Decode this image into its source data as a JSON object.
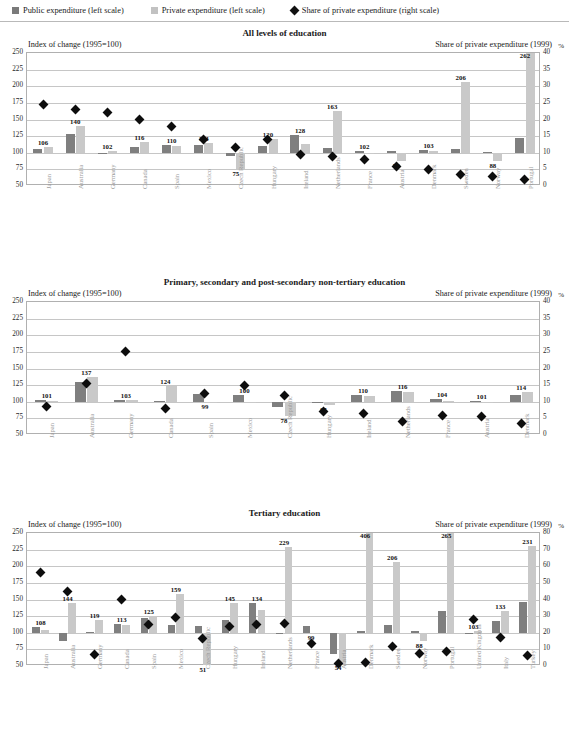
{
  "legend": {
    "items": [
      {
        "label": "Public expenditure (left scale)",
        "icon": "square-swatch-dark",
        "color": "#7a7a7a"
      },
      {
        "label": "Private expenditure (left scale)",
        "icon": "square-swatch-light",
        "color": "#c2c2c2"
      },
      {
        "label": "Share of private expenditure (right scale)",
        "icon": "diamond-marker",
        "color": "#111111"
      }
    ]
  },
  "chart_data": [
    {
      "type": "bar",
      "title": "All levels of education",
      "ylabel": "Index of change (1995=100)",
      "y2label": "Share of private expenditure (1999)",
      "pct_symbol": "%",
      "ylim": [
        50,
        250
      ],
      "yticks": [
        50,
        75,
        100,
        125,
        150,
        175,
        200,
        225,
        250
      ],
      "y2lim": [
        0,
        40
      ],
      "y2ticks": [
        0,
        5,
        10,
        15,
        20,
        25,
        30,
        35,
        40
      ],
      "grid": true,
      "legend_position": "top",
      "categories": [
        "Japan",
        "Australia",
        "Germany",
        "Canada",
        "Spain",
        "Mexico",
        "Czech Republic",
        "Hungary",
        "Ireland",
        "Netherlands",
        "France",
        "Austria",
        "Denmark",
        "Sweden",
        "Norway",
        "Portugal"
      ],
      "series": [
        {
          "name": "Public expenditure (left scale)",
          "values": [
            106,
            128,
            100,
            108,
            112,
            112,
            95,
            110,
            127,
            107,
            102,
            103,
            104,
            105,
            101,
            122
          ]
        },
        {
          "name": "Private expenditure (left scale)",
          "values": [
            108,
            140,
            102,
            116,
            110,
            114,
            75,
            120,
            113,
            163,
            100,
            88,
            102,
            206,
            88,
            262
          ]
        }
      ],
      "data_labels": [
        {
          "category": "Japan",
          "text": "106"
        },
        {
          "category": "Australia",
          "text": "140"
        },
        {
          "category": "Germany",
          "text": "102"
        },
        {
          "category": "Canada",
          "text": "116"
        },
        {
          "category": "Spain",
          "text": "110"
        },
        {
          "category": "Mexico",
          "text": "114"
        },
        {
          "category": "Czech Republic",
          "text": "75"
        },
        {
          "category": "Hungary",
          "text": "120"
        },
        {
          "category": "Ireland",
          "text": "128"
        },
        {
          "category": "Netherlands",
          "text": "163"
        },
        {
          "category": "France",
          "text": "102"
        },
        {
          "category": "Austria",
          "text": "79"
        },
        {
          "category": "Denmark",
          "text": "103"
        },
        {
          "category": "Sweden",
          "text": "206"
        },
        {
          "category": "Norway",
          "text": "88"
        },
        {
          "category": "Portugal",
          "text": "262"
        }
      ],
      "marker_series": {
        "name": "Share of private expenditure (right scale)",
        "values": [
          24.5,
          23.0,
          22.0,
          20.0,
          18.0,
          14.0,
          11.5,
          14.0,
          9.5,
          9.0,
          8.0,
          6.0,
          5.0,
          3.5,
          3.0,
          2.0
        ]
      }
    },
    {
      "type": "bar",
      "title": "Primary, secondary and post-secondary non-tertiary education",
      "ylabel": "Index of change (1995=100)",
      "y2label": "Share of private expenditure (1999)",
      "pct_symbol": "%",
      "ylim": [
        50,
        250
      ],
      "yticks": [
        50,
        75,
        100,
        125,
        150,
        175,
        200,
        225,
        250
      ],
      "y2lim": [
        0,
        40
      ],
      "y2ticks": [
        0,
        5,
        10,
        15,
        20,
        25,
        30,
        35,
        40
      ],
      "grid": true,
      "legend_position": "top",
      "categories": [
        "Japan",
        "Australia",
        "Germany",
        "Canada",
        "Spain",
        "Mexico",
        "Czech Republic",
        "Hungary",
        "Ireland",
        "Netherlands",
        "France",
        "Austria",
        "Denmark"
      ],
      "series": [
        {
          "name": "Public expenditure (left scale)",
          "values": [
            102,
            130,
            102,
            101,
            111,
            110,
            92,
            100,
            110,
            116,
            104,
            101,
            110
          ]
        },
        {
          "name": "Private expenditure (left scale)",
          "values": [
            101,
            137,
            103,
            124,
            99,
            100,
            78,
            95,
            108,
            114,
            101,
            100,
            114
          ]
        }
      ],
      "data_labels": [
        {
          "category": "Japan",
          "text": "101"
        },
        {
          "category": "Australia",
          "text": "137"
        },
        {
          "category": "Germany",
          "text": "103"
        },
        {
          "category": "Canada",
          "text": "124"
        },
        {
          "category": "Spain",
          "text": "99"
        },
        {
          "category": "Mexico",
          "text": "100"
        },
        {
          "category": "Czech Republic",
          "text": "78"
        },
        {
          "category": "Hungary",
          "text": "95"
        },
        {
          "category": "Ireland",
          "text": "110"
        },
        {
          "category": "Netherlands",
          "text": "116"
        },
        {
          "category": "France",
          "text": "104"
        },
        {
          "category": "Austria",
          "text": "101"
        },
        {
          "category": "Denmark",
          "text": "114"
        }
      ],
      "marker_series": {
        "name": "Share of private expenditure (right scale)",
        "values": [
          8.5,
          15.5,
          25.0,
          8.0,
          12.5,
          15.0,
          12.0,
          7.0,
          6.5,
          4.0,
          6.0,
          5.5,
          3.5
        ]
      }
    },
    {
      "type": "bar",
      "title": "Tertiary education",
      "ylabel": "Index of change (1995=100)",
      "y2label": "Share of private expenditure (1999)",
      "pct_symbol": "%",
      "ylim": [
        50,
        250
      ],
      "yticks": [
        50,
        75,
        100,
        125,
        150,
        175,
        200,
        225,
        250
      ],
      "y2lim": [
        0,
        80
      ],
      "y2ticks": [
        0,
        10,
        20,
        30,
        40,
        50,
        60,
        70,
        80
      ],
      "grid": true,
      "legend_position": "top",
      "categories": [
        "Japan",
        "Australia",
        "Germany",
        "Canada",
        "Spain",
        "Mexico",
        "Czech Republic",
        "Hungary",
        "Ireland",
        "Netherlands",
        "France",
        "Austria",
        "Denmark",
        "Sweden",
        "Norway",
        "Portugal",
        "United Kingdom",
        "Italy",
        "Turkey"
      ],
      "series": [
        {
          "name": "Public expenditure (left scale)",
          "values": [
            108,
            88,
            101,
            113,
            122,
            112,
            110,
            119,
            145,
            99,
            110,
            68,
            103,
            111,
            102,
            132,
            100,
            117,
            146
          ]
        },
        {
          "name": "Private expenditure (left scale)",
          "values": [
            104,
            144,
            119,
            112,
            125,
            159,
            51,
            145,
            134,
            229,
            99,
            54,
            406,
            206,
            88,
            265,
            103,
            133,
            231
          ]
        }
      ],
      "data_labels": [
        {
          "category": "Japan",
          "text": "108"
        },
        {
          "category": "Australia",
          "text": "144"
        },
        {
          "category": "Germany",
          "text": "119"
        },
        {
          "category": "Canada",
          "text": "113"
        },
        {
          "category": "Spain",
          "text": "125"
        },
        {
          "category": "Mexico",
          "text": "159"
        },
        {
          "category": "Czech Republic",
          "text": "51"
        },
        {
          "category": "Hungary",
          "text": "145"
        },
        {
          "category": "Ireland",
          "text": "134"
        },
        {
          "category": "Netherlands",
          "text": "229"
        },
        {
          "category": "France",
          "text": "99"
        },
        {
          "category": "Austria",
          "text": "54"
        },
        {
          "category": "Denmark",
          "text": "406"
        },
        {
          "category": "Sweden",
          "text": "206"
        },
        {
          "category": "Norway",
          "text": "88"
        },
        {
          "category": "Portugal",
          "text": "265"
        },
        {
          "category": "United Kingdom",
          "text": "103"
        },
        {
          "category": "Italy",
          "text": "133"
        },
        {
          "category": "Turkey",
          "text": "231"
        }
      ],
      "marker_series": {
        "name": "Share of private expenditure (right scale)",
        "values": [
          56.0,
          45.0,
          7.0,
          40.0,
          25.0,
          29.0,
          16.5,
          24.0,
          25.0,
          25.5,
          13.5,
          1.5,
          2.0,
          11.5,
          7.5,
          9.0,
          28.0,
          17.0,
          6.5
        ]
      }
    }
  ]
}
